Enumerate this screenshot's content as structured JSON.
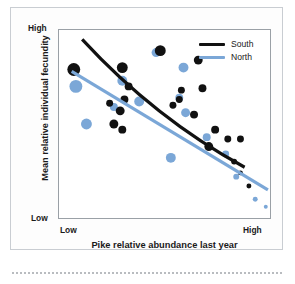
{
  "figure": {
    "x_axis_title": "Pike relative abundance last year",
    "y_axis_title": "Mean relative individual fecundity",
    "y_high_label": "High",
    "y_low_label": "Low",
    "x_low_label": "Low",
    "x_high_label": "High"
  },
  "legend": {
    "position": "top-right",
    "entries": [
      {
        "label": "South",
        "color": "#111111"
      },
      {
        "label": "North",
        "color": "#7ba7d7"
      }
    ]
  },
  "colors": {
    "south": "#111111",
    "north": "#7ba7d7",
    "axis": "#9aa0a6",
    "card_border": "#c9cdd2",
    "text": "#1a1a1a"
  },
  "chart_data": {
    "type": "scatter",
    "title": "",
    "xlabel": "Pike relative abundance last year",
    "ylabel": "Mean relative individual fecundity",
    "xlim": [
      0,
      100
    ],
    "ylim": [
      0,
      100
    ],
    "xtick_labels": [
      "Low",
      "High"
    ],
    "ytick_labels": [
      "Low",
      "High"
    ],
    "grid": false,
    "x_tick_count": 12,
    "y_tick_count": 8,
    "note": "Bubble size encodes sample weight; larger bubbles at low pike abundance.",
    "series": [
      {
        "name": "South",
        "color": "#111111",
        "points": [
          {
            "x": 7,
            "y": 79,
            "size": 13
          },
          {
            "x": 30,
            "y": 80,
            "size": 11
          },
          {
            "x": 48,
            "y": 89,
            "size": 11
          },
          {
            "x": 66,
            "y": 84,
            "size": 9
          },
          {
            "x": 33,
            "y": 70,
            "size": 8
          },
          {
            "x": 31,
            "y": 63,
            "size": 8
          },
          {
            "x": 29,
            "y": 57,
            "size": 9
          },
          {
            "x": 24,
            "y": 61,
            "size": 7
          },
          {
            "x": 26,
            "y": 50,
            "size": 9
          },
          {
            "x": 30,
            "y": 47,
            "size": 8
          },
          {
            "x": 57,
            "y": 63,
            "size": 7
          },
          {
            "x": 58,
            "y": 68,
            "size": 7
          },
          {
            "x": 68,
            "y": 69,
            "size": 8
          },
          {
            "x": 54,
            "y": 60,
            "size": 7
          },
          {
            "x": 64,
            "y": 55,
            "size": 8
          },
          {
            "x": 74,
            "y": 47,
            "size": 8
          },
          {
            "x": 80,
            "y": 42,
            "size": 7
          },
          {
            "x": 71,
            "y": 38,
            "size": 9
          },
          {
            "x": 86,
            "y": 42,
            "size": 7
          },
          {
            "x": 83,
            "y": 30,
            "size": 6
          },
          {
            "x": 86,
            "y": 24,
            "size": 5
          },
          {
            "x": 90,
            "y": 17,
            "size": 5
          }
        ],
        "trend": {
          "x0": 11,
          "y0": 95,
          "x1": 88,
          "y1": 27,
          "width": 3.2,
          "curved": true
        }
      },
      {
        "name": "North",
        "color": "#7ba7d7",
        "points": [
          {
            "x": 8,
            "y": 70,
            "size": 13
          },
          {
            "x": 13,
            "y": 50,
            "size": 11
          },
          {
            "x": 30,
            "y": 73,
            "size": 10
          },
          {
            "x": 38,
            "y": 62,
            "size": 10
          },
          {
            "x": 46,
            "y": 88,
            "size": 9
          },
          {
            "x": 59,
            "y": 80,
            "size": 10
          },
          {
            "x": 26,
            "y": 59,
            "size": 8
          },
          {
            "x": 57,
            "y": 64,
            "size": 8
          },
          {
            "x": 60,
            "y": 56,
            "size": 9
          },
          {
            "x": 53,
            "y": 32,
            "size": 10
          },
          {
            "x": 70,
            "y": 43,
            "size": 8
          },
          {
            "x": 79,
            "y": 34,
            "size": 7
          },
          {
            "x": 84,
            "y": 22,
            "size": 6
          },
          {
            "x": 93,
            "y": 10,
            "size": 5
          },
          {
            "x": 98,
            "y": 6,
            "size": 4
          }
        ],
        "trend": {
          "x0": 6,
          "y0": 78,
          "x1": 99,
          "y1": 15,
          "width": 3.2,
          "curved": false
        }
      }
    ]
  }
}
